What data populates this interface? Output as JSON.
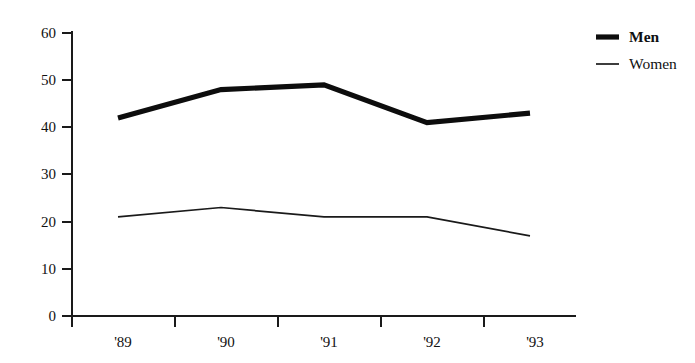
{
  "chart_data": {
    "type": "line",
    "title": "",
    "subtitle": "",
    "xlabel": "",
    "ylabel": "",
    "categories": [
      "'89",
      "'90",
      "'91",
      "'92",
      "'93"
    ],
    "series": [
      {
        "name": "Men",
        "values": [
          42,
          48,
          49,
          41,
          43
        ],
        "style": "thick-black"
      },
      {
        "name": "Women",
        "values": [
          21,
          23,
          21,
          21,
          17
        ],
        "style": "thin-black"
      }
    ],
    "ylim": [
      0,
      60
    ],
    "yticks": [
      0,
      10,
      20,
      30,
      40,
      50,
      60
    ],
    "ytick_labels": [
      "0",
      "10",
      "20",
      "30",
      "40",
      "50",
      "60"
    ],
    "xtick_labels": [
      "'89",
      "'90",
      "'91",
      "'92",
      "'93"
    ],
    "grid": false,
    "legend_position": "top-right",
    "legend": [
      {
        "label": "Men",
        "marker": "thick-line-swatch"
      },
      {
        "label": "Women",
        "marker": "thin-line-swatch"
      }
    ],
    "colors": {
      "men_line": "#0d0d0d",
      "women_line": "#1a1a1a",
      "axis": "#1a1a1a",
      "background": "#ffffff",
      "text": "#111111"
    }
  }
}
